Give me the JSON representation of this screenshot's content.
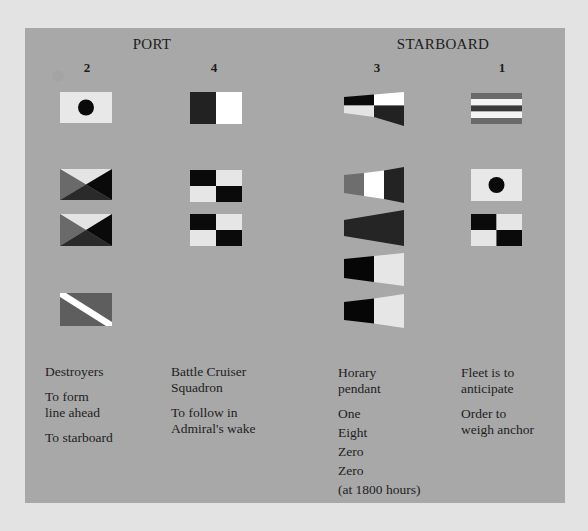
{
  "headings": {
    "port": "PORT",
    "starboard": "STARBOARD"
  },
  "columns": [
    {
      "number": "2",
      "side": "port",
      "flags": [
        "white-flag-black-dot",
        "diagonal-quartered-flag",
        "diagonal-quartered-flag",
        "diagonal-stripe-flag"
      ],
      "description": {
        "lines": [
          "Destroyers"
        ],
        "groups": [
          [
            "Destroyers"
          ],
          [
            "To form",
            "line ahead"
          ],
          [
            "To starboard"
          ]
        ]
      }
    },
    {
      "number": "4",
      "side": "port",
      "flags": [
        "half-dark-half-white-flag",
        "checkered-flag",
        "checkered-flag"
      ],
      "description": {
        "groups": [
          [
            "Battle Cruiser",
            "Squadron"
          ],
          [
            "To follow in",
            "Admiral's wake"
          ]
        ]
      }
    },
    {
      "number": "3",
      "side": "starboard",
      "flags": [
        "quartered-pennant",
        "three-band-pennant",
        "dark-pennant",
        "black-white-pennant",
        "black-white-pennant"
      ],
      "description": {
        "groups": [
          [
            "Horary",
            "pendant"
          ],
          [
            "One"
          ],
          [
            "Eight"
          ],
          [
            "Zero"
          ],
          [
            "Zero"
          ],
          [
            "(at 1800 hours)"
          ]
        ]
      }
    },
    {
      "number": "1",
      "side": "starboard",
      "flags": [
        "horizontal-striped-flag",
        "white-flag-black-dot",
        "checkered-flag"
      ],
      "description": {
        "groups": [
          [
            "Fleet is to",
            "anticipate"
          ],
          [
            "Order to",
            "weigh anchor"
          ]
        ]
      }
    }
  ],
  "colors": {
    "background": "#e3e3e3",
    "panel": "#a8a8a8",
    "flag_light": "#e8e8e8",
    "flag_white": "#ffffff",
    "flag_black": "#0a0a0a",
    "flag_dark": "#2a2a2a",
    "flag_mid": "#6a6a6a"
  }
}
